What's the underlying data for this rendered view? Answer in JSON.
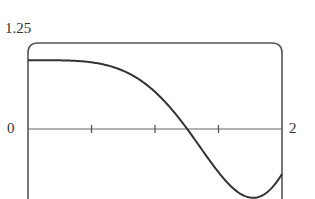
{
  "chart_data": {
    "type": "line",
    "title": "",
    "xlabel": "",
    "ylabel": "",
    "function_hint": "cos(x^2)",
    "xlim": [
      0,
      2
    ],
    "ylim": [
      -1,
      1.25
    ],
    "x_tick_positions": [
      0.5,
      1.0,
      1.5
    ],
    "x_tick_labels": [
      "2"
    ],
    "y_tick_labels": [
      "1.25",
      "0"
    ],
    "grid": false,
    "legend": null,
    "series": [
      {
        "name": "f(x)",
        "x": [
          0,
          0.25,
          0.5,
          0.75,
          1.0,
          1.1,
          1.25,
          1.4,
          1.5,
          1.6,
          1.77,
          1.9,
          2.0
        ],
        "y": [
          1.0,
          0.998,
          0.969,
          0.846,
          0.54,
          0.352,
          0.012,
          -0.38,
          -0.628,
          -0.839,
          -1.0,
          -0.895,
          -0.654
        ]
      }
    ],
    "line_color": "#333333"
  },
  "labels": {
    "y_top": "1.25",
    "y_zero": "0",
    "x_right": "2"
  }
}
